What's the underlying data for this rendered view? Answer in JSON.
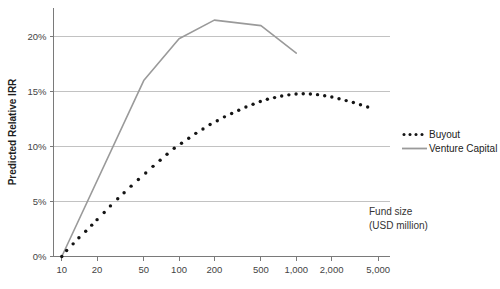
{
  "chart_data": {
    "type": "line",
    "title": "",
    "xlabel": "Fund size (USD million)",
    "ylabel": "Predicted Relative IRR",
    "xscale": "log",
    "xlim": [
      8.5,
      6300
    ],
    "ylim": [
      0,
      22.6
    ],
    "grid": true,
    "legend_position": "right",
    "x_tick_labels": [
      "10",
      "20",
      "50",
      "100",
      "200",
      "500",
      "1,000",
      "2,000",
      "5,000"
    ],
    "x_tick_values": [
      10,
      20,
      50,
      100,
      200,
      500,
      1000,
      2000,
      5000
    ],
    "y_tick_labels": [
      "0%",
      "5%",
      "10%",
      "15%",
      "20%"
    ],
    "y_tick_values": [
      0,
      5,
      10,
      15,
      20
    ],
    "series": [
      {
        "name": "Buyout",
        "style": "dotted",
        "color": "#141414",
        "x": [
          10,
          11,
          12.5,
          14,
          16,
          18,
          20,
          23,
          26,
          30,
          34,
          39,
          45,
          52,
          60,
          69,
          79,
          91,
          105,
          121,
          139,
          160,
          184,
          212,
          244,
          281,
          323,
          372,
          428,
          493,
          567,
          653,
          751,
          865,
          996,
          1146,
          1319,
          1518,
          1747,
          2011,
          2315,
          2664,
          3066,
          3529,
          4062
        ],
        "y": [
          0.0,
          0.55,
          1.15,
          1.7,
          2.3,
          2.85,
          3.35,
          4.0,
          4.6,
          5.25,
          5.8,
          6.4,
          7.0,
          7.6,
          8.2,
          8.75,
          9.3,
          9.85,
          10.3,
          10.75,
          11.2,
          11.6,
          12.0,
          12.35,
          12.7,
          13.0,
          13.3,
          13.6,
          13.85,
          14.1,
          14.3,
          14.45,
          14.6,
          14.7,
          14.78,
          14.8,
          14.78,
          14.72,
          14.62,
          14.5,
          14.35,
          14.18,
          14.0,
          13.8,
          13.6
        ]
      },
      {
        "name": "Venture Capital",
        "style": "solid",
        "color": "#9a9a9a",
        "x": [
          10,
          50,
          100,
          200,
          500,
          1000
        ],
        "y": [
          0.0,
          16.0,
          19.8,
          21.5,
          21.0,
          18.5
        ]
      }
    ]
  },
  "legend": {
    "items": [
      {
        "label": "Buyout",
        "marker": "dotted",
        "color": "#141414"
      },
      {
        "label": "Venture Capital",
        "marker": "solid-line",
        "color": "#9a9a9a"
      }
    ]
  },
  "axis_note": {
    "line1": "Fund size",
    "line2": "(USD million)"
  },
  "y_axis": {
    "title": "Predicted Relative IRR"
  }
}
